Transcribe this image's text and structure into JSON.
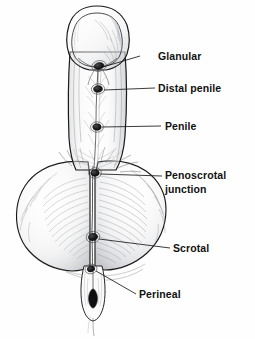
{
  "figure": {
    "background_color": "#fefefe",
    "ink_color": "#1a1a1a",
    "shading_color": "#9aa0a6",
    "width": 255,
    "height": 339
  },
  "labels": [
    {
      "id": "glanular",
      "text": "Glanular",
      "text_x": 158,
      "text_y": 50,
      "leader": {
        "x1": 140,
        "y1": 56,
        "x2": 103,
        "y2": 67
      },
      "marker": {
        "x": 99,
        "y": 66,
        "rx": 5.0,
        "ry": 3.4,
        "rot": -12
      }
    },
    {
      "id": "distal-penile",
      "text": "Distal penile",
      "text_x": 158,
      "text_y": 82,
      "leader": {
        "x1": 155,
        "y1": 88,
        "x2": 104,
        "y2": 90
      },
      "marker": {
        "x": 98,
        "y": 89,
        "rx": 4.4,
        "ry": 3.2,
        "rot": -6
      }
    },
    {
      "id": "penile",
      "text": "Penile",
      "text_x": 165,
      "text_y": 120,
      "leader": {
        "x1": 161,
        "y1": 126,
        "x2": 102,
        "y2": 127
      },
      "marker": {
        "x": 97,
        "y": 127,
        "rx": 4.2,
        "ry": 3.2,
        "rot": -4
      }
    },
    {
      "id": "penoscrotal-junction",
      "line1": "Penoscrotal",
      "line2": "junction",
      "text": "Penoscrotal junction",
      "text_x": 165,
      "text_y": 169,
      "leader": {
        "x1": 162,
        "y1": 176,
        "x2": 100,
        "y2": 174
      },
      "marker": {
        "x": 95,
        "y": 173,
        "rx": 4.2,
        "ry": 3.2,
        "rot": -8
      }
    },
    {
      "id": "scrotal",
      "text": "Scrotal",
      "text_x": 173,
      "text_y": 242,
      "leader": {
        "x1": 170,
        "y1": 248,
        "x2": 99,
        "y2": 239
      },
      "marker": {
        "x": 93,
        "y": 237,
        "rx": 4.6,
        "ry": 3.6,
        "rot": -10
      }
    },
    {
      "id": "perineal",
      "text": "Perineal",
      "text_x": 139,
      "text_y": 288,
      "leader": {
        "x1": 136,
        "y1": 294,
        "x2": 96,
        "y2": 271
      },
      "marker": {
        "x": 91,
        "y": 269,
        "rx": 3.8,
        "ry": 2.8,
        "rot": -14
      }
    }
  ]
}
